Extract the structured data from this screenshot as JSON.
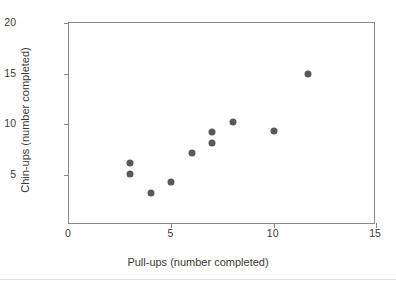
{
  "chart_data": {
    "type": "scatter",
    "title": "",
    "xlabel": "Pull-ups (number completed)",
    "ylabel": "Chin-ups (number completed)",
    "xlim": [
      0,
      15
    ],
    "ylim": [
      0,
      20
    ],
    "xticks": [
      "0",
      "5",
      "10",
      "15"
    ],
    "xtick_values": [
      0,
      5,
      10,
      15
    ],
    "yticks": [
      "5",
      "10",
      "15",
      "20"
    ],
    "ytick_values": [
      5,
      10,
      15,
      20
    ],
    "grid": false,
    "legend": "none",
    "marker_color": "#595959",
    "frame_color": "#8a8a8a",
    "background": "#ffffff",
    "x": [
      3,
      3,
      4,
      5,
      6,
      7,
      7,
      8,
      10,
      11.7
    ],
    "y": [
      6.1,
      5.05,
      3.2,
      4.3,
      7.1,
      9.2,
      8.1,
      10.2,
      9.3,
      15.0
    ],
    "points": [
      {
        "x": 3,
        "y": 6.1
      },
      {
        "x": 3,
        "y": 5.05
      },
      {
        "x": 4,
        "y": 3.2
      },
      {
        "x": 5,
        "y": 4.3
      },
      {
        "x": 6,
        "y": 7.1
      },
      {
        "x": 7,
        "y": 9.2
      },
      {
        "x": 7,
        "y": 8.1
      },
      {
        "x": 8,
        "y": 10.2
      },
      {
        "x": 10,
        "y": 9.3
      },
      {
        "x": 11.7,
        "y": 15.0
      }
    ]
  }
}
